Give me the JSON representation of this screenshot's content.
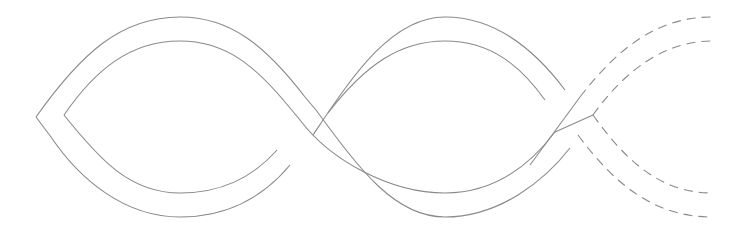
{
  "diagram": {
    "title": "Twisted band (braid) diagram",
    "stroke_color": "#8a8a8a",
    "background": "#ffffff",
    "line_styles": [
      "solid",
      "dashed"
    ],
    "crossings": 3
  }
}
